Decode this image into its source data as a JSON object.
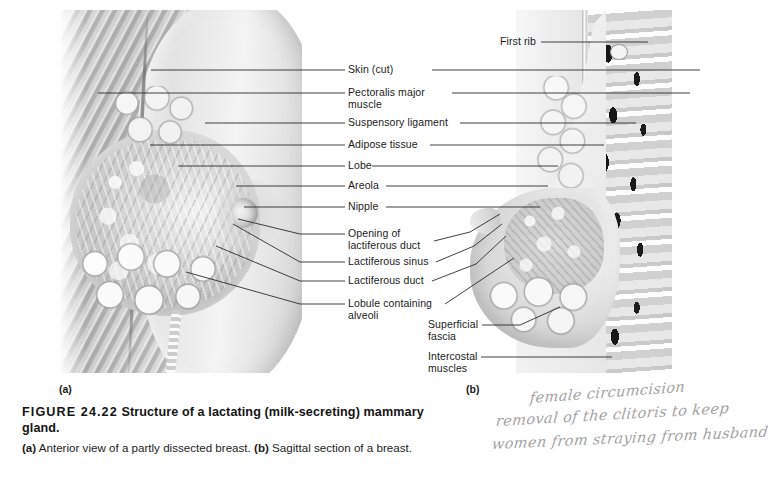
{
  "figure": {
    "number_label": "FIGURE 24.22",
    "title": "Structure of a lactating (milk-secreting) mammary gland.",
    "subcaption_a_tag": "(a)",
    "subcaption_a_text": "Anterior view of a partly dissected breast.",
    "subcaption_b_tag": "(b)",
    "subcaption_b_text": "Sagittal section of a breast.",
    "panel_a_label": "(a)",
    "panel_b_label": "(b)"
  },
  "labels_center": [
    {
      "text": "Skin (cut)",
      "lines": 1
    },
    {
      "text": "Pectoralis major\nmuscle",
      "lines": 2
    },
    {
      "text": "Suspensory ligament",
      "lines": 1
    },
    {
      "text": "Adipose tissue",
      "lines": 1
    },
    {
      "text": "Lobe",
      "lines": 1
    },
    {
      "text": "Areola",
      "lines": 1
    },
    {
      "text": "Nipple",
      "lines": 1
    },
    {
      "text": "Opening of\nlactiferous duct",
      "lines": 2
    },
    {
      "text": "Lactiferous sinus",
      "lines": 1
    },
    {
      "text": "Lactiferous duct",
      "lines": 1
    },
    {
      "text": "Lobule containing\nalveoli",
      "lines": 2
    }
  ],
  "labels_lower_right": [
    {
      "text": "Superficial\nfascia",
      "lines": 2
    },
    {
      "text": "Intercostal\nmuscles",
      "lines": 2
    }
  ],
  "labels_top_right": [
    {
      "text": "First rib",
      "lines": 1
    }
  ],
  "handwritten_note": {
    "line1": "female circumcision",
    "line2": "removal of the clitoris to keep",
    "line3": "women from straying from husband"
  },
  "colors": {
    "page_background": "#ffffff",
    "text": "#1b1b1b",
    "caption_text": "#141414",
    "leader_line": "#2b2b2b",
    "handwriting_ink": "#8e8e8e",
    "illustration_gray_light": "#f2f2f2",
    "illustration_gray_mid": "#c9c9c9",
    "illustration_gray_dark": "#9a9a9a"
  }
}
